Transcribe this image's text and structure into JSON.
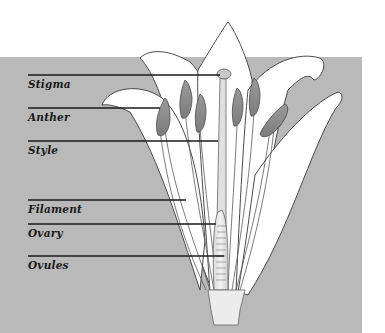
{
  "diagram": {
    "background_color": "#b9b9b9",
    "labels": [
      {
        "id": "stigma",
        "text": "Stigma"
      },
      {
        "id": "anther",
        "text": "Anther"
      },
      {
        "id": "style",
        "text": "Style"
      },
      {
        "id": "filament",
        "text": "Filament"
      },
      {
        "id": "ovary",
        "text": "Ovary"
      },
      {
        "id": "ovules",
        "text": "Ovules"
      }
    ]
  }
}
